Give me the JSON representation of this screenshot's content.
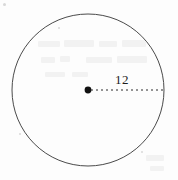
{
  "figure": {
    "type": "circle-radius-diagram",
    "canvas": {
      "width": 178,
      "height": 180,
      "background": "#fdfdfd"
    },
    "circle": {
      "name": "circle-outline",
      "center_x": 88,
      "center_y": 90,
      "radius_px": 76,
      "stroke_color": "#4a4a4a",
      "stroke_width": 1,
      "fill": "none"
    },
    "center_point": {
      "name": "center-point-dot",
      "x": 88,
      "y": 90,
      "radius_px": 3.4,
      "color": "#111111"
    },
    "radius_segment": {
      "name": "radius-dashed-line",
      "x1": 91,
      "y1": 90,
      "x2": 164,
      "y2": 90,
      "style": "dashed",
      "dash_pattern": "2 3",
      "color": "#2b2b2b",
      "stroke_width": 1
    },
    "radius_label": {
      "name": "radius-measure-label",
      "text": "12",
      "x": 115,
      "y": 73,
      "color": "#1d1d1d"
    },
    "artifacts": {
      "name": "scan-ghost-marks",
      "color": "#f2f2f2",
      "marks": [
        {
          "x": 38,
          "y": 41,
          "w": 22,
          "h": 6
        },
        {
          "x": 64,
          "y": 40,
          "w": 30,
          "h": 7
        },
        {
          "x": 99,
          "y": 41,
          "w": 18,
          "h": 6
        },
        {
          "x": 122,
          "y": 40,
          "w": 24,
          "h": 7
        },
        {
          "x": 41,
          "y": 57,
          "w": 14,
          "h": 6
        },
        {
          "x": 60,
          "y": 56,
          "w": 10,
          "h": 6
        },
        {
          "x": 86,
          "y": 57,
          "w": 26,
          "h": 6
        },
        {
          "x": 117,
          "y": 56,
          "w": 30,
          "h": 7
        },
        {
          "x": 45,
          "y": 72,
          "w": 20,
          "h": 5
        },
        {
          "x": 72,
          "y": 72,
          "w": 16,
          "h": 5
        },
        {
          "x": 146,
          "y": 155,
          "w": 18,
          "h": 6
        },
        {
          "x": 150,
          "y": 166,
          "w": 14,
          "h": 5
        }
      ],
      "specks": [
        {
          "x": 3,
          "y": 3,
          "d": 3
        },
        {
          "x": 19,
          "y": 133,
          "d": 2
        },
        {
          "x": 141,
          "y": 151,
          "d": 2
        },
        {
          "x": 58,
          "y": 27,
          "d": 2
        }
      ]
    }
  }
}
